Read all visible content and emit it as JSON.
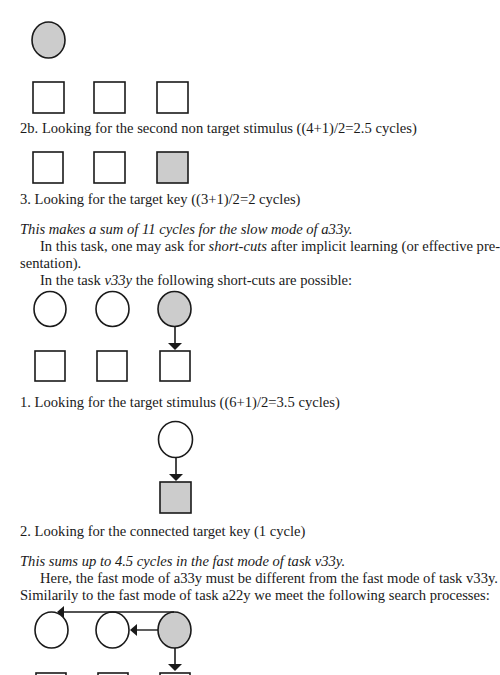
{
  "page": {
    "fill_color": "#cccccc",
    "stroke_color": "#1a1a1a"
  },
  "captions": {
    "step_2b": "2b. Looking for the second non target stimulus ((4+1)/2=2.5 cycles)",
    "step_3": "3. Looking for the target key ((3+1)/2=2 cycles)",
    "step_1_fast": "1. Looking for the target stimulus ((6+1)/2=3.5 cycles)",
    "step_2_fast": "2. Looking for the connected target key (1 cycle)"
  },
  "paragraphs": {
    "sum_slow": "This makes a sum of 11 cycles for the slow mode of a33y.",
    "shortcuts_a": "In this task, one may ask for ",
    "shortcuts_em": "short-cuts",
    "shortcuts_b": " after implicit learning (or effective pre-",
    "shortcuts_c": "sentation).",
    "task_a": "In the task ",
    "task_em": "v33y",
    "task_b": " the following short-cuts are possible:",
    "sum_fast": "This sums up to 4.5 cycles in the fast mode of task v33y.",
    "here": "Here, the fast mode of a33y must be different from the fast mode of task v33y.",
    "similarly": "Similarily to the fast mode of task a22y we meet the following search processes:"
  },
  "figures": [
    {
      "id": "fig-2b",
      "description": "one filled circle above three empty squares"
    },
    {
      "id": "fig-3",
      "description": "three squares, third filled"
    },
    {
      "id": "fig-shortcut",
      "description": "three circles (third filled) with arrow down to third square"
    },
    {
      "id": "fig-connected",
      "description": "single circle with arrow to filled square"
    },
    {
      "id": "fig-a33y-fast",
      "description": "three circles; arrows from filled third circle to first and second circle, and down to key"
    }
  ]
}
